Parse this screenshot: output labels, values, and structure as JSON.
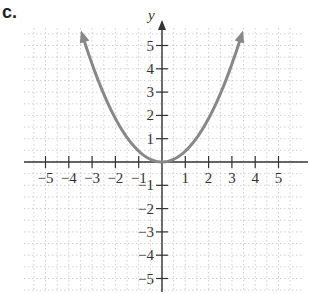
{
  "part_label": "c.",
  "chart_data": {
    "type": "line",
    "title": "",
    "xlabel": "",
    "ylabel": "y",
    "function": "y = x^2",
    "xlim": [
      -5.8,
      5.8
    ],
    "ylim": [
      -5.8,
      5.8
    ],
    "grid": true,
    "x_ticks": [
      -5,
      -4,
      -3,
      -2,
      -1,
      1,
      2,
      3,
      4,
      5
    ],
    "y_ticks": [
      -5,
      -4,
      -3,
      -2,
      -1,
      1,
      2,
      3,
      4,
      5
    ],
    "x_tick_labels": [
      "−5",
      "−4",
      "−3",
      "−2",
      "−1",
      "1",
      "2",
      "3",
      "4",
      "5"
    ],
    "y_tick_labels": [
      "−5",
      "−4",
      "−3",
      "−2",
      "−1",
      "1",
      "2",
      "3",
      "4",
      "5"
    ],
    "series": [
      {
        "name": "parabola",
        "x": [
          -3.4,
          -3,
          -2.5,
          -2,
          -1.5,
          -1,
          -0.5,
          0,
          0.5,
          1,
          1.5,
          2,
          2.5,
          3,
          3.4
        ],
        "values": [
          11.56,
          9,
          6.25,
          4,
          2.25,
          1,
          0.25,
          0,
          0.25,
          1,
          2.25,
          4,
          6.25,
          9,
          11.56
        ],
        "color": "#888888",
        "arrows": "both"
      }
    ],
    "axis_color": "#333333",
    "grid_color": "#bbbbbb"
  }
}
